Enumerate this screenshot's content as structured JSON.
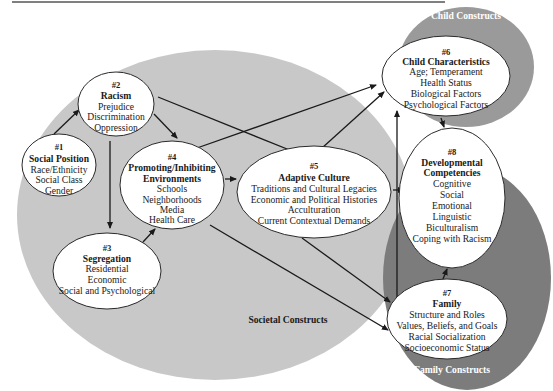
{
  "colors": {
    "societal_region": "#c8c8c8",
    "child_region": "#9a9a9a",
    "family_region": "#7c7c7c",
    "node_fill": "#ffffff",
    "arrow": "#1a1a1a"
  },
  "regions": {
    "societal": "Societal Constructs",
    "child": "Child Constructs",
    "family": "Family Constructs"
  },
  "nodes": {
    "n1": {
      "number": "#1",
      "title": "Social Position",
      "items": [
        "Race/Ethnicity",
        "Social Class",
        "Gender"
      ]
    },
    "n2": {
      "number": "#2",
      "title": "Racism",
      "items": [
        "Prejudice",
        "Discrimination",
        "Oppression"
      ]
    },
    "n3": {
      "number": "#3",
      "title": "Segregation",
      "items": [
        "Residential",
        "Economic",
        "Social and Psychological"
      ]
    },
    "n4": {
      "number": "#4",
      "title": "Promoting/Inhibiting",
      "title2": "Environments",
      "items": [
        "Schools",
        "Neighborhoods",
        "Media",
        "Health Care"
      ]
    },
    "n5": {
      "number": "#5",
      "title": "Adaptive Culture",
      "items": [
        "Traditions and Cultural Legacies",
        "Economic and Political Histories",
        "Acculturation",
        "Current Contextual Demands"
      ]
    },
    "n6": {
      "number": "#6",
      "title": "Child Characteristics",
      "items": [
        "Age; Temperament",
        "Health Status",
        "Biological Factors",
        "Psychological Factors"
      ]
    },
    "n7": {
      "number": "#7",
      "title": "Family",
      "items": [
        "Structure and Roles",
        "Values, Beliefs, and Goals",
        "Racial Socialization",
        "Socioeconomic Status"
      ]
    },
    "n8": {
      "number": "#8",
      "title": "Developmental",
      "title2": "Competencies",
      "items": [
        "Cognitive",
        "Social",
        "Emotional",
        "Linguistic",
        "Biculturalism",
        "Coping with Racism"
      ]
    }
  },
  "edges": [
    {
      "from": "#1",
      "to": "#2"
    },
    {
      "from": "#2",
      "to": "#3"
    },
    {
      "from": "#2",
      "to": "#4"
    },
    {
      "from": "#2",
      "to": "#5"
    },
    {
      "from": "#3",
      "to": "#4"
    },
    {
      "from": "#4",
      "to": "#5"
    },
    {
      "from": "#4",
      "to": "#6"
    },
    {
      "from": "#4",
      "to": "#7"
    },
    {
      "from": "#5",
      "to": "#6"
    },
    {
      "from": "#5",
      "to": "#7"
    },
    {
      "from": "#5",
      "to": "#8"
    },
    {
      "from": "#6",
      "to": "#8"
    },
    {
      "from": "#7",
      "to": "#8"
    },
    {
      "from": "#6",
      "to": "#7",
      "bidirectional": true
    }
  ]
}
